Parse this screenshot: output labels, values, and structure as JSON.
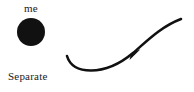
{
  "figure": {
    "background_color": "#ffffff",
    "ink_color": "#111111"
  },
  "panels": [
    {
      "id": "separate",
      "caption": "Separate",
      "self_label": "me",
      "shape": "filled-circle"
    },
    {
      "id": "extended",
      "caption": "Extended",
      "self_label": "me",
      "shape": "s-curve-with-arrowhead"
    }
  ],
  "left_panel": {
    "self_label": "me",
    "caption": "Separate"
  },
  "right_panel": {
    "self_label": "me",
    "caption": "Extended"
  }
}
